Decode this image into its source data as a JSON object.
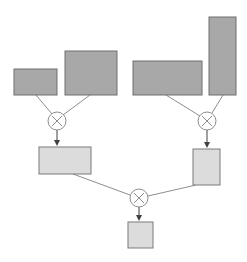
{
  "diagram": {
    "type": "tensor-product-tree",
    "colors": {
      "input_fill": "#a8a8a8",
      "input_stroke": "#6e6e6e",
      "intermediate_fill": "#dcdcdc",
      "intermediate_stroke": "#7a7a7a",
      "edge": "#808080",
      "operator_stroke": "#808080"
    },
    "inputs": [
      {
        "id": "A",
        "x": 14,
        "y": 69,
        "w": 43,
        "h": 26
      },
      {
        "id": "B",
        "x": 65,
        "y": 51,
        "w": 52,
        "h": 44
      },
      {
        "id": "C",
        "x": 133,
        "y": 61,
        "w": 69,
        "h": 34
      },
      {
        "id": "D",
        "x": 209,
        "y": 17,
        "w": 27,
        "h": 78
      }
    ],
    "operators": [
      {
        "id": "op1",
        "symbol": "⊗",
        "cx": 57,
        "cy": 121,
        "r": 9
      },
      {
        "id": "op2",
        "symbol": "⊗",
        "cx": 207,
        "cy": 121,
        "r": 9
      },
      {
        "id": "op3",
        "symbol": "⊗",
        "cx": 139,
        "cy": 198,
        "r": 9
      }
    ],
    "intermediates": [
      {
        "id": "AB",
        "x": 39,
        "y": 147,
        "w": 52,
        "h": 27
      },
      {
        "id": "CD",
        "x": 193,
        "y": 149,
        "w": 27,
        "h": 36
      }
    ],
    "output": {
      "id": "ABCD",
      "x": 128,
      "y": 222,
      "w": 25,
      "h": 26
    }
  }
}
